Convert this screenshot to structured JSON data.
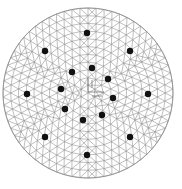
{
  "diagram": {
    "type": "circular-triangular-mesh",
    "circle": {
      "cx": 88,
      "cy": 93,
      "r": 85
    },
    "mesh_color": "#8a8a8a",
    "dot_color": "#111111",
    "dot_radius": 3.2,
    "rings": 11,
    "dots": [
      {
        "x": 87,
        "y": 33
      },
      {
        "x": 45,
        "y": 51
      },
      {
        "x": 130,
        "y": 51
      },
      {
        "x": 72,
        "y": 72
      },
      {
        "x": 92,
        "y": 68
      },
      {
        "x": 108,
        "y": 79
      },
      {
        "x": 27,
        "y": 94
      },
      {
        "x": 61,
        "y": 89
      },
      {
        "x": 148,
        "y": 94
      },
      {
        "x": 113,
        "y": 98
      },
      {
        "x": 65,
        "y": 109
      },
      {
        "x": 83,
        "y": 120
      },
      {
        "x": 102,
        "y": 115
      },
      {
        "x": 45,
        "y": 137
      },
      {
        "x": 130,
        "y": 137
      },
      {
        "x": 87,
        "y": 155
      }
    ],
    "center_marker": {
      "x": 88,
      "y": 92
    }
  }
}
